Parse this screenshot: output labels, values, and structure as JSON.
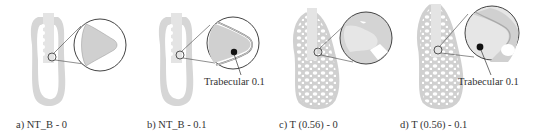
{
  "figure": {
    "colors": {
      "bone": "#d3d3d3",
      "bone_dark": "#bdbdbd",
      "implant": "#e6e6e6",
      "outline": "#555555",
      "background": "#ffffff"
    },
    "panels": [
      {
        "id": "a",
        "caption": "a) NT_B - 0",
        "model": "non-trabecular",
        "callout": null
      },
      {
        "id": "b",
        "caption": "b) NT_B - 0.1",
        "model": "non-trabecular",
        "callout": "Trabecular 0.1"
      },
      {
        "id": "c",
        "caption": "c) T (0.56) - 0",
        "model": "trabecular",
        "callout": null
      },
      {
        "id": "d",
        "caption": "d) T (0.56) - 0.1",
        "model": "trabecular",
        "callout": "Trabecular 0.1"
      }
    ]
  }
}
